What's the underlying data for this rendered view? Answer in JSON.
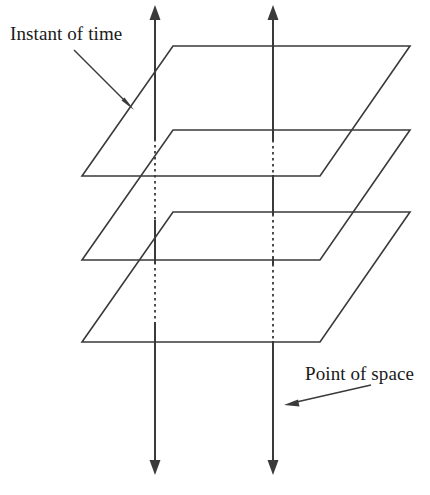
{
  "figure": {
    "background_color": "#ffffff",
    "ink_color": "#3a3a3a",
    "width": 430,
    "height": 495,
    "labels": {
      "instant_of_time": "Instant of time",
      "point_of_space": "Point of space"
    },
    "label_positions": {
      "instant_of_time": {
        "x": 10,
        "y": 40
      },
      "point_of_space": {
        "x": 305,
        "y": 380
      }
    },
    "leaders": [
      {
        "name": "instant-of-time-leader",
        "from": {
          "x": 74,
          "y": 50
        },
        "to": {
          "x": 130,
          "y": 106
        }
      },
      {
        "name": "point-of-space-leader",
        "from": {
          "x": 370,
          "y": 385
        },
        "to": {
          "x": 285,
          "y": 404
        }
      }
    ],
    "planes": [
      {
        "name": "plane-top",
        "label": "Instant of time (upper plane)",
        "top_left": {
          "x": 173,
          "y": 46
        },
        "top_right": {
          "x": 410,
          "y": 46
        },
        "bottom_right": {
          "x": 320,
          "y": 176
        },
        "bottom_left": {
          "x": 82,
          "y": 176
        }
      },
      {
        "name": "plane-middle",
        "label": "Instant of time (middle plane)",
        "top_left": {
          "x": 173,
          "y": 130
        },
        "top_right": {
          "x": 410,
          "y": 130
        },
        "bottom_right": {
          "x": 320,
          "y": 260
        },
        "bottom_left": {
          "x": 82,
          "y": 260
        }
      },
      {
        "name": "plane-bottom",
        "label": "Instant of time (lower plane)",
        "top_left": {
          "x": 173,
          "y": 212
        },
        "top_right": {
          "x": 410,
          "y": 212
        },
        "bottom_right": {
          "x": 320,
          "y": 342
        },
        "bottom_left": {
          "x": 82,
          "y": 342
        }
      }
    ],
    "axes": [
      {
        "name": "world-line-left",
        "label": "Point of space (left world line)",
        "x": 155,
        "top_tip_y": 5,
        "bottom_tip_y": 475,
        "double_headed": true,
        "visible_segments": [
          [
            16,
            139
          ],
          [
            221,
            345
          ],
          [
            345,
            464
          ]
        ],
        "hidden_segments": [
          [
            139,
            221
          ],
          [
            262,
            322
          ]
        ]
      },
      {
        "name": "world-line-right",
        "label": "Point of space (right world line)",
        "x": 273,
        "top_tip_y": 5,
        "bottom_tip_y": 475,
        "double_headed": true,
        "visible_segments": [
          [
            16,
            140
          ],
          [
            176,
            214
          ],
          [
            259,
            264
          ],
          [
            342,
            464
          ]
        ],
        "hidden_segments": [
          [
            140,
            176
          ],
          [
            214,
            259
          ],
          [
            264,
            342
          ]
        ]
      }
    ]
  }
}
